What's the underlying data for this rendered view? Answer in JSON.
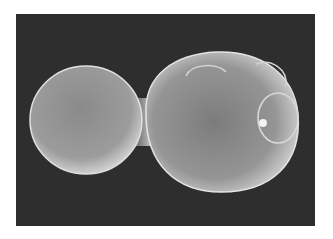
{
  "image": {
    "subject": "budding yeast cell (scanning electron micrograph)",
    "colors": {
      "background": "#ffffff",
      "frame": "#2e2e2e",
      "cell_highlight": "#e6e6e6",
      "cell_mid": "#9a9a9a",
      "cell_shadow": "#5a5a5a"
    }
  }
}
